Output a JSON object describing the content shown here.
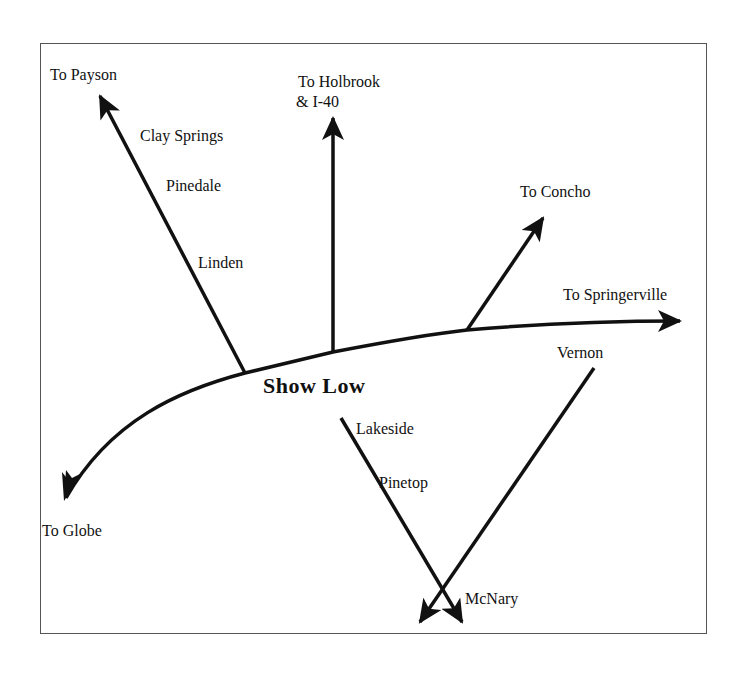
{
  "map": {
    "title": "Show Low",
    "colors": {
      "line": "#111111",
      "frame": "#555555",
      "background": "#ffffff"
    },
    "destinations": {
      "payson": "To Payson",
      "holbrook_line1": "To Holbrook",
      "holbrook_line2": "& I-40",
      "concho": "To Concho",
      "springerville": "To Springerville",
      "globe": "To Globe"
    },
    "towns": {
      "clay_springs": "Clay Springs",
      "pinedale": "Pinedale",
      "linden": "Linden",
      "lakeside": "Lakeside",
      "pinetop": "Pinetop",
      "vernon": "Vernon",
      "mcnary": "McNary"
    }
  }
}
